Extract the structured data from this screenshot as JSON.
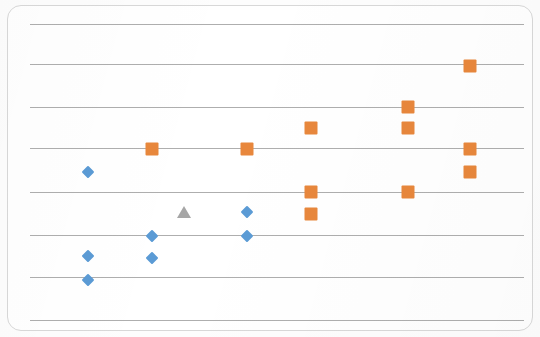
{
  "chart_data": {
    "type": "scatter",
    "title": "",
    "subtitle": "",
    "xlabel": "",
    "ylabel": "",
    "xlim": [
      0,
      540
    ],
    "ylim": [
      0,
      337
    ],
    "grid": true,
    "grid_orientation": "horizontal",
    "gridline_count": 8,
    "gridline_positions_px": [
      24,
      64,
      107,
      148,
      192,
      235,
      277,
      320
    ],
    "gridline_color": "#a7a7a7",
    "axis_tick_labels_visible": false,
    "legend_visible": false,
    "legend_position": "none",
    "annotations": [],
    "note": "Scanned/photographed chart. No axis tick labels, title or legend are rendered in the image; only horizontal gridlines and plotted markers are visible.",
    "series": [
      {
        "name": "Series 1",
        "marker": "diamond",
        "color": "#5b9bd5",
        "points_px": [
          {
            "x": 88,
            "y": 172
          },
          {
            "x": 88,
            "y": 256
          },
          {
            "x": 88,
            "y": 280
          },
          {
            "x": 152,
            "y": 236
          },
          {
            "x": 152,
            "y": 258
          },
          {
            "x": 247,
            "y": 212
          },
          {
            "x": 247,
            "y": 236
          }
        ]
      },
      {
        "name": "Series 2",
        "marker": "square",
        "color": "#e8873c",
        "points_px": [
          {
            "x": 152,
            "y": 149
          },
          {
            "x": 247,
            "y": 149
          },
          {
            "x": 311,
            "y": 128
          },
          {
            "x": 311,
            "y": 192
          },
          {
            "x": 311,
            "y": 214
          },
          {
            "x": 408,
            "y": 107
          },
          {
            "x": 408,
            "y": 128
          },
          {
            "x": 408,
            "y": 192
          },
          {
            "x": 470,
            "y": 66
          },
          {
            "x": 470,
            "y": 149
          },
          {
            "x": 470,
            "y": 172
          }
        ]
      },
      {
        "name": "Series 3",
        "marker": "triangle",
        "color": "#a6a6a6",
        "points_px": [
          {
            "x": 184,
            "y": 212
          }
        ]
      }
    ]
  },
  "card": {
    "border_color": "#d8d8d8",
    "background": "#ffffff"
  }
}
